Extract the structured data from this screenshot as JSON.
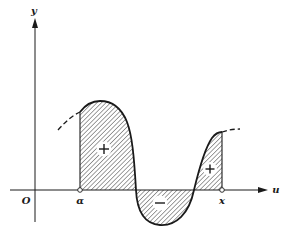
{
  "figure": {
    "axes": {
      "horizontal_label": "u",
      "vertical_label": "y",
      "origin_label": "O"
    },
    "points": {
      "lower_limit_label": "α",
      "upper_limit_label": "x"
    },
    "regions": [
      {
        "sign": "+",
        "position": "left-positive-lobe"
      },
      {
        "sign": "−",
        "position": "negative-lobe"
      },
      {
        "sign": "+",
        "position": "right-positive-lobe"
      }
    ],
    "colors": {
      "ink": "#1a1a1a",
      "background": "#ffffff"
    }
  }
}
